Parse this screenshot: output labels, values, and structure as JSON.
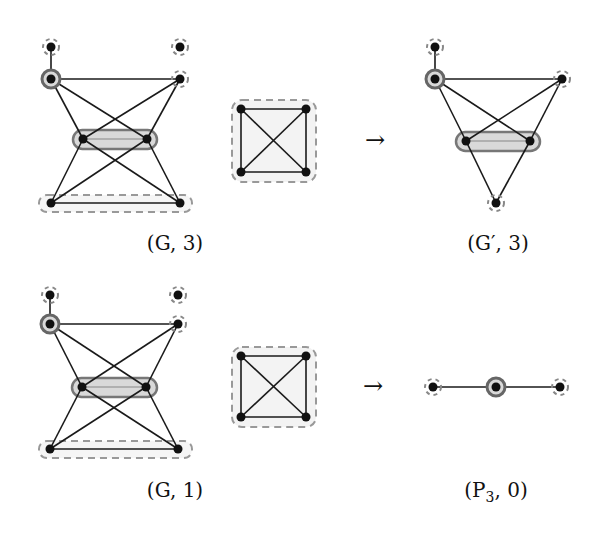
{
  "figure": {
    "rows": [
      {
        "left_graph": {
          "label": "(G, 3)",
          "nodes": [
            {
              "id": "a",
              "x": 51,
              "y": 47,
              "marker": "dashed"
            },
            {
              "id": "b",
              "x": 180,
              "y": 47,
              "marker": "dashed"
            },
            {
              "id": "c",
              "x": 51,
              "y": 79,
              "marker": "solid-ring"
            },
            {
              "id": "d",
              "x": 180,
              "y": 79,
              "marker": "dashed"
            },
            {
              "id": "e",
              "x": 83,
              "y": 139,
              "marker": "pill"
            },
            {
              "id": "f",
              "x": 147,
              "y": 139,
              "marker": "pill"
            },
            {
              "id": "g",
              "x": 51,
              "y": 203,
              "marker": "dashed-pill"
            },
            {
              "id": "h",
              "x": 180,
              "y": 203,
              "marker": "dashed-pill"
            }
          ]
        },
        "k4": {
          "x1": 241,
          "y1": 109,
          "x2": 306,
          "y2": 172
        },
        "arrow": "→",
        "right_graph": {
          "label": "(G′, 3)",
          "nodes": [
            {
              "id": "a",
              "x": 435,
              "y": 47,
              "marker": "dashed"
            },
            {
              "id": "c",
              "x": 435,
              "y": 79,
              "marker": "solid-ring"
            },
            {
              "id": "d",
              "x": 562,
              "y": 79,
              "marker": "dashed"
            },
            {
              "id": "e",
              "x": 466,
              "y": 141,
              "marker": "pill"
            },
            {
              "id": "f",
              "x": 530,
              "y": 141,
              "marker": "pill"
            },
            {
              "id": "g",
              "x": 496,
              "y": 203,
              "marker": "dashed"
            }
          ]
        }
      },
      {
        "left_graph": {
          "label": "(G, 1)"
        },
        "k4": {
          "x1": 241,
          "y1": 356,
          "x2": 306,
          "y2": 417
        },
        "arrow": "→",
        "right_graph": {
          "label": "(P₃, 0)",
          "nodes": [
            {
              "id": "p1",
              "x": 433,
              "y": 387,
              "marker": "dashed"
            },
            {
              "id": "p2",
              "x": 496,
              "y": 387,
              "marker": "solid-ring"
            },
            {
              "id": "p3",
              "x": 560,
              "y": 387,
              "marker": "dashed"
            }
          ]
        }
      }
    ],
    "labels": {
      "top_left": "(G, 3)",
      "top_right": "(G′, 3)",
      "bottom_left": "(G, 1)",
      "bottom_right_main": "(P",
      "bottom_right_sub": "3",
      "bottom_right_tail": ", 0)",
      "arrow": "→"
    }
  }
}
